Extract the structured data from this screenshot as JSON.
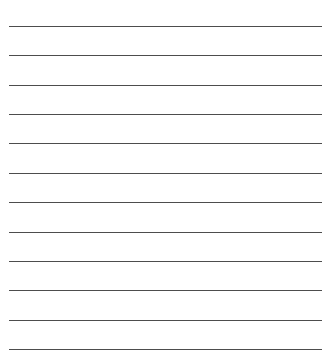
{
  "page": {
    "type": "lined-paper",
    "background_color": "#ffffff",
    "line_color": "#3a3a3a",
    "line_count": 12,
    "lines": [
      {
        "y": 26
      },
      {
        "y": 55
      },
      {
        "y": 85
      },
      {
        "y": 114
      },
      {
        "y": 143
      },
      {
        "y": 173
      },
      {
        "y": 202
      },
      {
        "y": 232
      },
      {
        "y": 261
      },
      {
        "y": 290
      },
      {
        "y": 320
      },
      {
        "y": 349
      }
    ]
  }
}
